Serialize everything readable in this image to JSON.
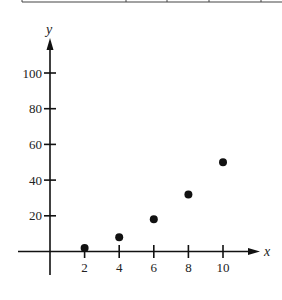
{
  "table_fragment": {
    "visible": true,
    "column_dividers_x": [
      22,
      126,
      167,
      209,
      261
    ]
  },
  "chart_data": {
    "type": "scatter",
    "title": "",
    "xlabel": "x",
    "ylabel": "y",
    "x": [
      2,
      4,
      6,
      8,
      10
    ],
    "y": [
      2,
      8,
      18,
      32,
      50
    ],
    "series": [
      {
        "name": "data",
        "x": [
          2,
          4,
          6,
          8,
          10
        ],
        "y": [
          2,
          8,
          18,
          32,
          50
        ]
      }
    ],
    "x_ticks": [
      2,
      4,
      6,
      8,
      10
    ],
    "y_ticks": [
      20,
      40,
      60,
      80,
      100
    ],
    "xlim": [
      -2,
      12
    ],
    "ylim": [
      -10,
      118
    ],
    "grid": false,
    "legend": null,
    "marker_color": "#111111"
  },
  "labels": {
    "x_axis": "x",
    "y_axis": "y",
    "x_ticks": [
      "2",
      "4",
      "6",
      "8",
      "10"
    ],
    "y_ticks": [
      "20",
      "40",
      "60",
      "80",
      "100"
    ]
  }
}
